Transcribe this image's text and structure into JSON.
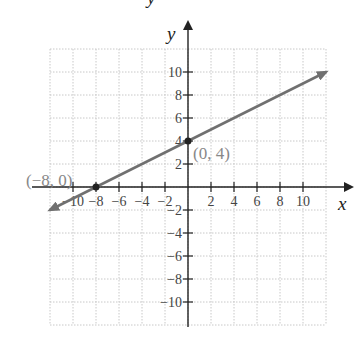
{
  "chart_data": {
    "type": "line",
    "title": "",
    "xlabel": "x",
    "ylabel": "y",
    "xlim": [
      -12,
      12
    ],
    "ylim": [
      -12,
      12
    ],
    "grid": true,
    "x_ticks": [
      -10,
      -8,
      -6,
      -4,
      -2,
      2,
      4,
      6,
      8,
      10
    ],
    "y_ticks": [
      10,
      8,
      6,
      4,
      2,
      -2,
      -4,
      -6,
      -8,
      -10
    ],
    "x_tick_labels": [
      "−10",
      "−8",
      "−6",
      "−4",
      "−2",
      "2",
      "4",
      "6",
      "8",
      "10"
    ],
    "y_tick_labels": [
      "10",
      "8",
      "6",
      "4",
      "2",
      "−2",
      "−4",
      "−6",
      "−8",
      "−10"
    ],
    "series": [
      {
        "name": "y = 0.5x + 4",
        "slope": 0.5,
        "intercept": 4,
        "x": [
          -12,
          12
        ],
        "y": [
          -2,
          10
        ],
        "arrows_both_ends": true,
        "color": "#707070"
      }
    ],
    "points": [
      {
        "x": -8,
        "y": 0,
        "label": "(−8, 0)"
      },
      {
        "x": 0,
        "y": 4,
        "label": "(0, 4)"
      }
    ],
    "annotations": [
      "(−8, 0)",
      "(0, 4)"
    ]
  },
  "labels": {
    "x_axis": "x",
    "y_axis": "y",
    "top_cropped": "y"
  },
  "colors": {
    "axis": "#222222",
    "grid": "#c8c8c8",
    "line": "#707070",
    "point": "#222222",
    "point_label": "#888888"
  }
}
